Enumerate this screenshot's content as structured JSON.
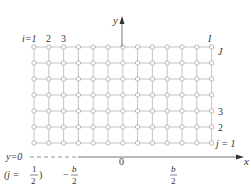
{
  "diagram": {
    "grid": {
      "columns": 13,
      "rows": 7,
      "x0": 34,
      "dx": 14.8,
      "y0": 47,
      "dy": 16,
      "line_color": "#b5b5b5",
      "node_color": "#a8a8a8"
    },
    "axes": {
      "x_label": "x",
      "y_label": "y",
      "origin_label": "0",
      "line_color": "#555555"
    },
    "column_labels": {
      "i_first": "i=1",
      "second": "2",
      "third": "3",
      "last": "I"
    },
    "row_labels": {
      "last": "J",
      "third": "3",
      "second": "2",
      "first": "j = 1"
    },
    "boundary": {
      "y_zero": "y=0",
      "j_half_open": "(j =",
      "j_half_num": "1",
      "j_half_den": "2",
      "j_half_close": ")"
    },
    "x_ticks": {
      "neg_half_sign": "−",
      "neg_half_num": "b",
      "neg_half_den": "2",
      "pos_half_num": "b",
      "pos_half_den": "2"
    }
  }
}
